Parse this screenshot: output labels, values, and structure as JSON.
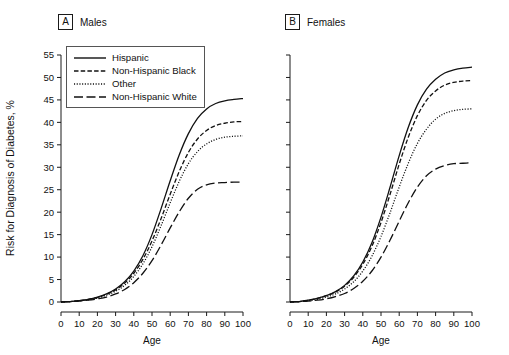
{
  "figure": {
    "y_axis_title": "Risk for Diagnosis of Diabetes, %",
    "x_axis_title": "Age"
  },
  "panels": [
    {
      "letter": "A",
      "caption": "Males"
    },
    {
      "letter": "B",
      "caption": "Females"
    }
  ],
  "legend": {
    "items": [
      {
        "label": "Hispanic",
        "style": "solid"
      },
      {
        "label": "Non-Hispanic Black",
        "style": "dashed"
      },
      {
        "label": "Other",
        "style": "dotted"
      },
      {
        "label": "Non-Hispanic White",
        "style": "longdash"
      }
    ]
  },
  "chart_data": [
    {
      "type": "line",
      "title": "Males",
      "panel_letter": "A",
      "xlabel": "Age",
      "ylabel": "Risk for Diagnosis of Diabetes, %",
      "xlim": [
        0,
        100
      ],
      "ylim": [
        0,
        55
      ],
      "xticks": [
        0,
        10,
        20,
        30,
        40,
        50,
        60,
        70,
        80,
        90,
        100
      ],
      "yticks": [
        0,
        5,
        10,
        15,
        20,
        25,
        30,
        35,
        40,
        45,
        50,
        55
      ],
      "grid": false,
      "legend_position": "upper-left",
      "x": [
        0,
        5,
        10,
        15,
        20,
        25,
        30,
        35,
        40,
        45,
        50,
        55,
        60,
        65,
        70,
        75,
        80,
        85,
        90,
        95,
        100
      ],
      "series": [
        {
          "name": "Hispanic",
          "style": "solid",
          "values": [
            0.0,
            0.1,
            0.3,
            0.6,
            1.1,
            1.8,
            2.9,
            4.5,
            6.9,
            10.3,
            15.0,
            20.8,
            27.0,
            32.8,
            37.5,
            40.9,
            43.0,
            44.2,
            44.8,
            45.1,
            45.3
          ]
        },
        {
          "name": "Non-Hispanic Black",
          "style": "dashed",
          "values": [
            0.0,
            0.1,
            0.3,
            0.6,
            1.0,
            1.7,
            2.7,
            4.2,
            6.4,
            9.5,
            13.6,
            18.6,
            24.0,
            29.1,
            33.3,
            36.3,
            38.2,
            39.3,
            39.8,
            40.1,
            40.2
          ]
        },
        {
          "name": "Other",
          "style": "dotted",
          "values": [
            0.0,
            0.1,
            0.3,
            0.5,
            0.9,
            1.5,
            2.4,
            3.7,
            5.7,
            8.5,
            12.3,
            17.0,
            22.1,
            26.9,
            30.8,
            33.5,
            35.2,
            36.2,
            36.7,
            36.9,
            37.0
          ]
        },
        {
          "name": "Non-Hispanic White",
          "style": "longdash",
          "values": [
            0.0,
            0.1,
            0.2,
            0.4,
            0.7,
            1.1,
            1.8,
            2.8,
            4.3,
            6.4,
            9.2,
            12.7,
            16.5,
            20.1,
            23.1,
            25.1,
            26.1,
            26.5,
            26.6,
            26.7,
            26.7
          ]
        }
      ]
    },
    {
      "type": "line",
      "title": "Females",
      "panel_letter": "B",
      "xlabel": "Age",
      "ylabel": "Risk for Diagnosis of Diabetes, %",
      "xlim": [
        0,
        100
      ],
      "ylim": [
        0,
        55
      ],
      "xticks": [
        0,
        10,
        20,
        30,
        40,
        50,
        60,
        70,
        80,
        90,
        100
      ],
      "yticks": [
        0,
        5,
        10,
        15,
        20,
        25,
        30,
        35,
        40,
        45,
        50,
        55
      ],
      "grid": false,
      "legend_position": "none",
      "x": [
        0,
        5,
        10,
        15,
        20,
        25,
        30,
        35,
        40,
        45,
        50,
        55,
        60,
        65,
        70,
        75,
        80,
        85,
        90,
        95,
        100
      ],
      "series": [
        {
          "name": "Hispanic",
          "style": "solid",
          "values": [
            0.0,
            0.1,
            0.4,
            0.8,
            1.4,
            2.3,
            3.7,
            5.8,
            8.9,
            13.2,
            18.9,
            25.6,
            32.6,
            38.9,
            43.9,
            47.4,
            49.6,
            51.0,
            51.7,
            52.1,
            52.3
          ]
        },
        {
          "name": "Non-Hispanic Black",
          "style": "dashed",
          "values": [
            0.0,
            0.1,
            0.4,
            0.8,
            1.4,
            2.2,
            3.5,
            5.5,
            8.4,
            12.4,
            17.7,
            24.0,
            30.7,
            36.7,
            41.5,
            44.9,
            47.0,
            48.3,
            48.9,
            49.2,
            49.3
          ]
        },
        {
          "name": "Other",
          "style": "dotted",
          "values": [
            0.0,
            0.1,
            0.3,
            0.6,
            1.1,
            1.8,
            2.9,
            4.5,
            6.9,
            10.2,
            14.6,
            19.9,
            25.6,
            30.9,
            35.3,
            38.5,
            40.7,
            42.0,
            42.6,
            42.9,
            43.0
          ]
        },
        {
          "name": "Non-Hispanic White",
          "style": "longdash",
          "values": [
            0.0,
            0.1,
            0.2,
            0.4,
            0.7,
            1.2,
            1.9,
            3.0,
            4.6,
            6.9,
            10.0,
            13.8,
            18.0,
            22.1,
            25.6,
            28.1,
            29.6,
            30.4,
            30.8,
            30.9,
            31.0
          ]
        }
      ]
    }
  ]
}
